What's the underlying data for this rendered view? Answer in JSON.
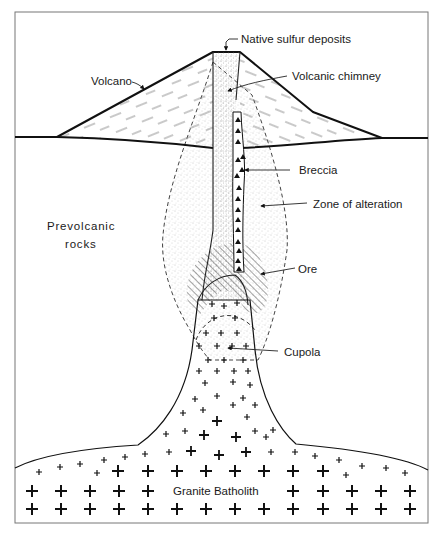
{
  "diagram": {
    "labels": {
      "native_sulfur": "Native sulfur deposits",
      "volcano": "Volcano",
      "volcanic_chimney": "Volcanic chimney",
      "breccia": "Breccia",
      "zone_of_alteration": "Zone of alteration",
      "prevolcanic_line1": "Prevolcanic",
      "prevolcanic_line2": "rocks",
      "ore": "Ore",
      "cupola": "Cupola",
      "granite_batholith": "Granite Batholith"
    },
    "colors": {
      "line": "#111111",
      "stipple": "#9a9a9a",
      "background": "#ffffff",
      "frame": "#777777"
    }
  }
}
